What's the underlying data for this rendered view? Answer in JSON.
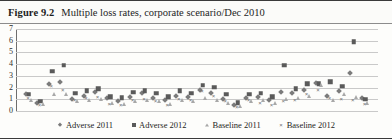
{
  "figure": {
    "number": "Figure 9.2",
    "caption": "Multiple loss rates, corporate scenario/Dec 2010"
  },
  "chart_data": {
    "type": "scatter",
    "title": "Multiple loss rates, corporate scenario/Dec 2010",
    "xlabel": "",
    "ylabel": "",
    "ylim": [
      0,
      7
    ],
    "yticks": [
      0,
      1,
      2,
      3,
      4,
      5,
      6,
      7
    ],
    "ytick_labels": [
      "0",
      "1",
      "2",
      "3",
      "4",
      "5",
      "6",
      "7"
    ],
    "grid": true,
    "xaxis_ticklabels_shown": false,
    "legend_position": "bottom",
    "n_categories": 30,
    "x": [
      1,
      2,
      3,
      4,
      5,
      6,
      7,
      8,
      9,
      10,
      11,
      12,
      13,
      14,
      15,
      16,
      17,
      18,
      19,
      20,
      21,
      22,
      23,
      24,
      25,
      26,
      27,
      28,
      29,
      30
    ],
    "series": [
      {
        "name": "Adverse 2011",
        "marker": "diamond",
        "color": "#7b7b7b",
        "values": [
          1.5,
          0.8,
          2.4,
          2.6,
          1.1,
          1.4,
          1.7,
          1.2,
          0.9,
          1.3,
          1.6,
          1.2,
          1.0,
          1.4,
          1.3,
          1.9,
          1.6,
          1.1,
          0.6,
          1.2,
          1.3,
          1.0,
          1.7,
          1.6,
          1.9,
          2.5,
          1.4,
          1.8,
          3.3,
          1.2
        ]
      },
      {
        "name": "Adverse 2012",
        "marker": "square",
        "color": "#5a5a5a",
        "values": [
          1.5,
          0.9,
          3.5,
          4.0,
          1.6,
          1.8,
          2.0,
          1.3,
          1.2,
          1.7,
          1.8,
          1.6,
          1.3,
          1.8,
          1.6,
          2.3,
          2.1,
          1.5,
          0.8,
          1.5,
          1.6,
          1.3,
          4.0,
          2.0,
          2.4,
          2.4,
          2.6,
          2.2,
          6.0,
          1.1
        ]
      },
      {
        "name": "Baseline 2011",
        "marker": "triangle",
        "color": "#a8a8a8",
        "values": [
          1.0,
          0.7,
          1.5,
          1.5,
          0.9,
          1.0,
          1.1,
          0.8,
          0.7,
          0.9,
          1.0,
          0.9,
          0.7,
          1.0,
          0.9,
          1.2,
          1.0,
          0.8,
          0.5,
          0.9,
          1.0,
          0.8,
          1.1,
          1.2,
          1.4,
          2.3,
          1.0,
          1.5,
          1.3,
          0.8
        ]
      },
      {
        "name": "Baseline 2012",
        "marker": "cross",
        "color": "#6f6f6f",
        "values": [
          1.2,
          0.6,
          2.2,
          1.9,
          1.0,
          1.2,
          1.3,
          0.7,
          0.6,
          1.0,
          1.1,
          0.9,
          0.6,
          1.1,
          1.0,
          1.8,
          1.4,
          0.9,
          0.4,
          1.0,
          0.8,
          0.6,
          0.9,
          1.0,
          1.5,
          1.9,
          1.2,
          1.1,
          1.0,
          0.7
        ]
      }
    ]
  },
  "legend": [
    {
      "label": "Adverse 2011",
      "marker": "diamond"
    },
    {
      "label": "Adverse 2012",
      "marker": "square"
    },
    {
      "label": "Baseline 2011",
      "marker": "triangle"
    },
    {
      "label": "Baseline 2012",
      "marker": "cross"
    }
  ]
}
